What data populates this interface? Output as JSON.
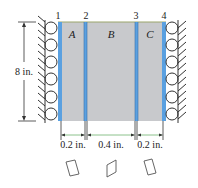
{
  "figure": {
    "type": "composite-bar-with-roller-supports",
    "node_labels": [
      "1",
      "2",
      "3",
      "4"
    ],
    "regions": [
      {
        "label": "A",
        "width": "0.2 in."
      },
      {
        "label": "B",
        "width": "0.4 in."
      },
      {
        "label": "C",
        "width": "0.2 in."
      }
    ],
    "height_label": "8 in.",
    "element_icons": [
      "parallelogram-element-A",
      "parallelogram-element-B",
      "parallelogram-element-C"
    ],
    "colors": {
      "fill": "#c8c9cc",
      "blue_interface": "#5aa0e0",
      "top_edge": "#9aa56a",
      "dimension_green": "#6fb36f",
      "line": "#333333"
    }
  }
}
